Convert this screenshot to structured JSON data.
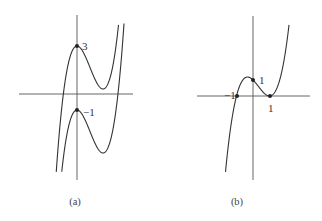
{
  "figure": {
    "panels": [
      {
        "id": "a",
        "caption": "(a)",
        "points": [
          {
            "label": "3",
            "x": 0,
            "y": 3
          },
          {
            "label": "−1",
            "x": 0,
            "y": -1
          }
        ],
        "curves": [
          "upper cubic with local max at (0, 3)",
          "lower cubic with local max at (0, −1)"
        ]
      },
      {
        "id": "b",
        "caption": "(b)",
        "points": [
          {
            "label": "−1",
            "x": -1,
            "y": 0
          },
          {
            "label": "1",
            "x": 0,
            "y": 1
          },
          {
            "label": "1",
            "x": 1,
            "y": 0
          }
        ],
        "curves": [
          "cubic through (−1,0), (0,1), touching x-axis at (1,0)"
        ]
      }
    ]
  }
}
